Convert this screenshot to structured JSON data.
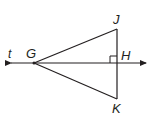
{
  "diagram": {
    "type": "geometry",
    "line": {
      "label": "t",
      "double_arrow": true
    },
    "points": {
      "G": {
        "label": "G",
        "x": 34,
        "y": 63
      },
      "J": {
        "label": "J",
        "x": 117,
        "y": 29
      },
      "H": {
        "label": "H",
        "x": 117,
        "y": 63
      },
      "K": {
        "label": "K",
        "x": 117,
        "y": 99
      }
    },
    "right_angle_at": "H",
    "colors": {
      "stroke": "#231f20",
      "background": "#ffffff"
    }
  }
}
